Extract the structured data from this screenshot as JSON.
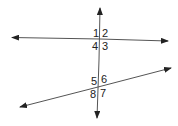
{
  "diagram": {
    "line_color": "#333333",
    "angle_labels": {
      "a1": "1",
      "a2": "2",
      "a3": "3",
      "a4": "4",
      "a5": "5",
      "a6": "6",
      "a7": "7",
      "a8": "8"
    }
  }
}
